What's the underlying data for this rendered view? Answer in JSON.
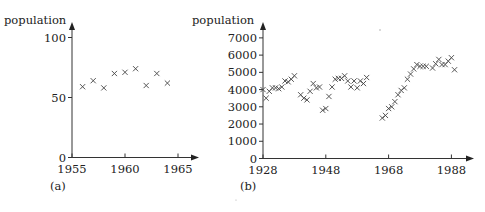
{
  "chart_data": [
    {
      "type": "scatter",
      "panel_label": "(a)",
      "title": "",
      "xlabel": "",
      "ylabel": "population",
      "xlim": [
        1955,
        1967
      ],
      "ylim": [
        0,
        110
      ],
      "xticks": [
        1955,
        1960,
        1965
      ],
      "yticks": [
        0,
        50,
        100
      ],
      "grid": false,
      "legend": null,
      "marker": "x",
      "x": [
        1956,
        1957,
        1958,
        1959,
        1960,
        1961,
        1962,
        1963,
        1964
      ],
      "y": [
        59,
        64,
        58,
        70,
        71,
        74,
        60,
        70,
        62
      ]
    },
    {
      "type": "scatter",
      "panel_label": "(b)",
      "title": "",
      "xlabel": "",
      "ylabel": "population",
      "xlim": [
        1928,
        1995
      ],
      "ylim": [
        0,
        7500
      ],
      "xticks": [
        1928,
        1948,
        1968,
        1988
      ],
      "yticks": [
        0,
        1000,
        2000,
        3000,
        4000,
        5000,
        6000,
        7000
      ],
      "grid": false,
      "legend": null,
      "marker": "x",
      "x": [
        1928,
        1929,
        1930,
        1931,
        1932,
        1933,
        1934,
        1935,
        1936,
        1937,
        1938,
        1940,
        1941,
        1942,
        1943,
        1944,
        1945,
        1946,
        1947,
        1948,
        1949,
        1950,
        1951,
        1952,
        1953,
        1954,
        1955,
        1956,
        1957,
        1958,
        1959,
        1960,
        1961,
        1966,
        1967,
        1968,
        1969,
        1970,
        1971,
        1972,
        1973,
        1974,
        1975,
        1976,
        1977,
        1978,
        1979,
        1980,
        1982,
        1983,
        1984,
        1985,
        1986,
        1987,
        1988,
        1989
      ],
      "y": [
        4000,
        3500,
        3900,
        4100,
        4100,
        4050,
        4150,
        4500,
        4450,
        4600,
        4800,
        3700,
        3500,
        3400,
        3900,
        4350,
        4100,
        4150,
        2800,
        2900,
        3600,
        4150,
        4600,
        4650,
        4650,
        4800,
        4500,
        4150,
        4500,
        4100,
        4500,
        4350,
        4700,
        2350,
        2500,
        2900,
        3000,
        3300,
        3700,
        3950,
        4100,
        4600,
        4900,
        5200,
        5450,
        5350,
        5350,
        5350,
        5250,
        5500,
        5750,
        5450,
        5450,
        5650,
        5850,
        5150
      ]
    }
  ],
  "layout": {
    "panels": [
      {
        "x0_px": 72,
        "x_per_unit": 10.6,
        "x_origin": 1955,
        "y0_px": 157.5,
        "y_per_unit": 1.2,
        "axis_left": 72,
        "axis_right": 199,
        "axis_top": 22,
        "axis_bottom": 157.5,
        "ylabel_x": 4,
        "ylabel_y": 24,
        "panel_label_x": 50,
        "panel_label_y": 190
      },
      {
        "x0_px": 263,
        "x_per_unit": 3.14,
        "x_origin": 1928,
        "y0_px": 158.5,
        "y_per_unit": 0.01723,
        "axis_left": 263,
        "axis_right": 474,
        "axis_top": 22,
        "axis_bottom": 158.5,
        "ylabel_x": 192,
        "ylabel_y": 24,
        "panel_label_x": 240,
        "panel_label_y": 190
      }
    ]
  }
}
